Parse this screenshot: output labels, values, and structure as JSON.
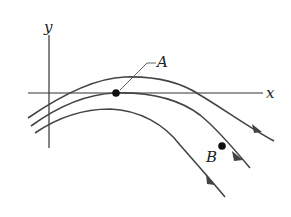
{
  "diagram": {
    "type": "streamlines",
    "axes": {
      "x_label": "x",
      "y_label": "y"
    },
    "points": [
      {
        "id": "A",
        "label": "A",
        "on_streamline": 2
      },
      {
        "id": "B",
        "label": "B",
        "on_streamline": 2
      }
    ],
    "streamline_count": 3,
    "colors": {
      "line": "#444444",
      "point": "#111111",
      "axis": "#333333"
    }
  }
}
